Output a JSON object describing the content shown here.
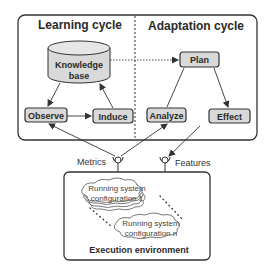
{
  "diagram": {
    "learning_cycle": {
      "title": "Learning cycle",
      "nodes": {
        "knowledge_base": [
          "Knowledge",
          "base"
        ],
        "observe": "Observe",
        "induce": "Induce"
      }
    },
    "adaptation_cycle": {
      "title": "Adaptation cycle",
      "nodes": {
        "plan": "Plan",
        "analyze": "Analyze",
        "effect": "Effect"
      }
    },
    "interfaces": {
      "metrics": "Metrics",
      "features": "Features"
    },
    "execution_environment": {
      "title": "Execution environment",
      "config_1": [
        "Running system",
        "configuration 1"
      ],
      "config_n": [
        "Running system",
        "configuration n"
      ]
    },
    "edges": [
      {
        "from": "Knowledge base",
        "to": "Observe",
        "style": "solid"
      },
      {
        "from": "Observe",
        "to": "Induce",
        "style": "solid"
      },
      {
        "from": "Induce",
        "to": "Knowledge base",
        "style": "solid"
      },
      {
        "from": "Knowledge base",
        "to": "Plan",
        "style": "dotted"
      },
      {
        "from": "Analyze",
        "to": "Plan",
        "style": "solid"
      },
      {
        "from": "Plan",
        "to": "Effect",
        "style": "solid"
      },
      {
        "from": "Metrics",
        "to": "Observe",
        "style": "solid"
      },
      {
        "from": "Metrics",
        "to": "Analyze",
        "style": "solid"
      },
      {
        "from": "Effect",
        "to": "Features",
        "style": "solid"
      }
    ],
    "colors": {
      "node_fill": "#d9d9d9",
      "stroke": "#333333",
      "background": "#ffffff"
    }
  }
}
